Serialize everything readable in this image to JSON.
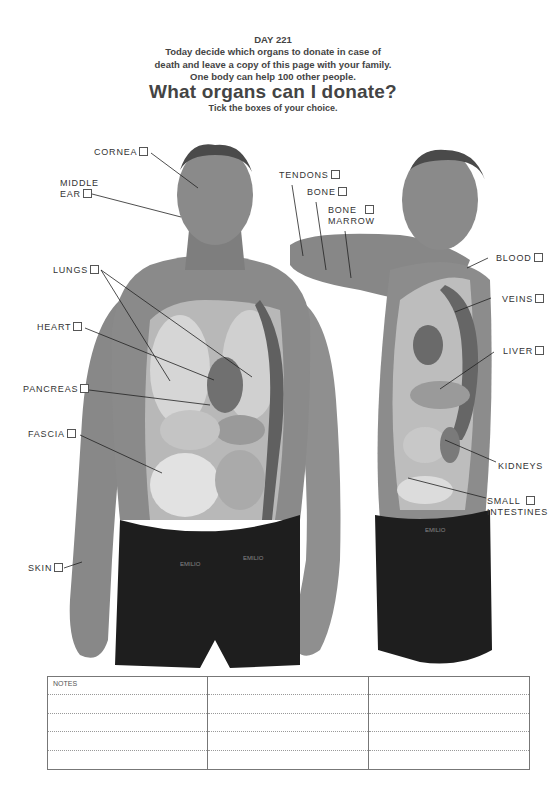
{
  "header": {
    "day": "DAY 221",
    "intro_lines": [
      "Today decide which organs to donate in case of",
      "death and leave a copy of this page with your family.",
      "One body can help 100 other people."
    ],
    "title": "What organs can I donate?",
    "subtitle": "Tick the boxes of your choice."
  },
  "labels": {
    "cornea": "CORNEA",
    "middle_ear_1": "MIDDLE",
    "middle_ear_2": "EAR",
    "lungs": "LUNGS",
    "heart": "HEART",
    "pancreas": "PANCREAS",
    "fascia": "FASCIA",
    "skin": "SKIN",
    "tendons": "TENDONS",
    "bone": "BONE",
    "bone_marrow_1": "BONE",
    "bone_marrow_2": "MARROW",
    "blood": "BLOOD",
    "veins": "VEINS",
    "liver": "LIVER",
    "kidneys": "KIDNEYS",
    "small_intestines_1": "SMALL",
    "small_intestines_2": "INTESTINES"
  },
  "underwear_brand": "EMILIO",
  "notes": {
    "label": "NOTES",
    "columns": 3,
    "rows": 5
  },
  "colors": {
    "text": "#3a3a3a",
    "skin": "#8c8c8c",
    "organ_light": "#d4d4d4",
    "organ_dark": "#5a5a5a",
    "underwear": "#1e1e1e"
  }
}
